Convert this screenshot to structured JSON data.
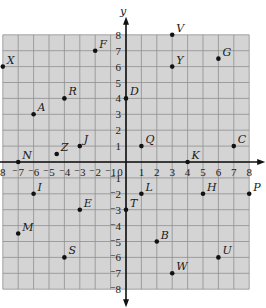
{
  "chart_data": {
    "type": "scatter",
    "title": "",
    "xlabel": "",
    "ylabel": "y",
    "xlim": [
      -8,
      8
    ],
    "ylim": [
      -8,
      8
    ],
    "grid": true,
    "x_ticks": [
      "8",
      "7",
      "6",
      "5",
      "4",
      "3",
      "2",
      "1",
      "0",
      "1",
      "2",
      "3",
      "4",
      "5",
      "6",
      "7",
      "8"
    ],
    "x_tick_values": [
      -8,
      -7,
      -6,
      -5,
      -4,
      -3,
      -2,
      -1,
      0,
      1,
      2,
      3,
      4,
      5,
      6,
      7,
      8
    ],
    "y_ticks_positive": [
      "1",
      "2",
      "3",
      "4",
      "5",
      "6",
      "7",
      "8"
    ],
    "y_ticks_negative": [
      "1",
      "2",
      "3",
      "4",
      "5",
      "6",
      "7",
      "8"
    ],
    "negative_mark": "⁻",
    "points": [
      {
        "label": "V",
        "x": 3,
        "y": 8
      },
      {
        "label": "F",
        "x": -2,
        "y": 7
      },
      {
        "label": "X",
        "x": -8,
        "y": 6
      },
      {
        "label": "Y",
        "x": 3,
        "y": 6
      },
      {
        "label": "G",
        "x": 6,
        "y": 6.5
      },
      {
        "label": "D",
        "x": 0,
        "y": 4
      },
      {
        "label": "R",
        "x": -4,
        "y": 4
      },
      {
        "label": "A",
        "x": -6,
        "y": 3
      },
      {
        "label": "J",
        "x": -3,
        "y": 1
      },
      {
        "label": "Z",
        "x": -4.5,
        "y": 0.5
      },
      {
        "label": "Q",
        "x": 1,
        "y": 1
      },
      {
        "label": "C",
        "x": 7,
        "y": 1
      },
      {
        "label": "N",
        "x": -7,
        "y": 0
      },
      {
        "label": "K",
        "x": 4,
        "y": 0
      },
      {
        "label": "I",
        "x": -6,
        "y": -2
      },
      {
        "label": "L",
        "x": 1,
        "y": -2
      },
      {
        "label": "H",
        "x": 5,
        "y": -2
      },
      {
        "label": "P",
        "x": 8,
        "y": -2
      },
      {
        "label": "E",
        "x": -3,
        "y": -3
      },
      {
        "label": "T",
        "x": 0,
        "y": -3
      },
      {
        "label": "M",
        "x": -7,
        "y": -4.5
      },
      {
        "label": "B",
        "x": 2,
        "y": -5
      },
      {
        "label": "S",
        "x": -4,
        "y": -6
      },
      {
        "label": "U",
        "x": 6,
        "y": -6
      },
      {
        "label": "W",
        "x": 3,
        "y": -7
      }
    ]
  },
  "colors": {
    "grid_background": "#d4d4d4",
    "grid_line": "#8f8f8f",
    "axis": "#111111",
    "point": "#111111"
  }
}
